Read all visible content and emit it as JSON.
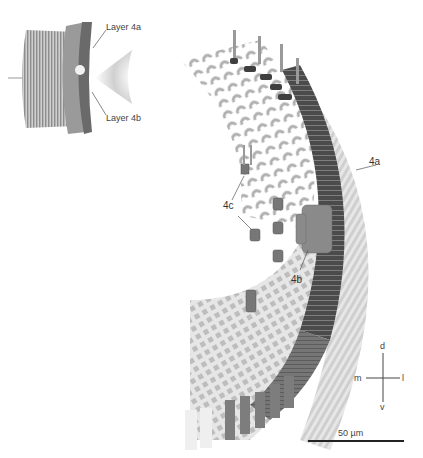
{
  "figure": {
    "inset": {
      "labels": {
        "layer_4a": "Layer 4a",
        "layer_4b": "Layer 4b"
      }
    },
    "main": {
      "labels": {
        "l4a": "4a",
        "l4b": "4b",
        "l4c": "4c"
      }
    },
    "compass": {
      "dorsal": "d",
      "ventral": "v",
      "medial": "m",
      "lateral": "l"
    },
    "scale_bar": {
      "label": "50 µm"
    },
    "colors": {
      "dark_layer": "#4a4a4a",
      "mid_layer": "#7a7a7a",
      "light_cells": "#b5b5b5",
      "pale_outer": "#d8d8d8",
      "background": "#ffffff"
    }
  }
}
